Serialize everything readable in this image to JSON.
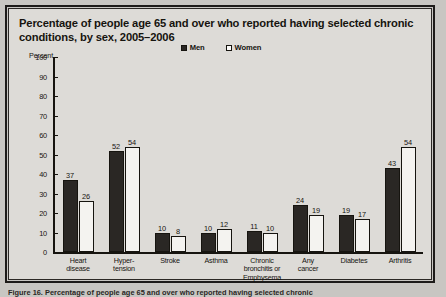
{
  "figure": {
    "title": "Percentage of people age 65 and over who reported having selected chronic conditions, by sex, 2005–2006",
    "axis_title": "Percent",
    "caption": "Figure 16. Percentage of people age 65 and over who reported having selected chronic"
  },
  "legend": {
    "items": [
      {
        "label": "Men",
        "marker": "filled-square-icon",
        "color": "#2a2724"
      },
      {
        "label": "Women",
        "marker": "open-square-icon",
        "color": "#ffffff"
      }
    ]
  },
  "chart_data": {
    "type": "bar",
    "title": "Percentage of people age 65 and over who reported having selected chronic conditions, by sex, 2005–2006",
    "xlabel": "",
    "ylabel": "Percent",
    "ylim": [
      0,
      100
    ],
    "yticks": [
      0,
      10,
      20,
      30,
      40,
      50,
      60,
      70,
      80,
      90,
      100
    ],
    "grid": false,
    "legend_position": "top-center",
    "categories": [
      "Heart disease",
      "Hyper-tension",
      "Stroke",
      "Asthma",
      "Chronic bronchitis or Emphysema",
      "Any cancer",
      "Diabetes",
      "Arthritis"
    ],
    "category_lines": [
      [
        "Heart",
        "disease"
      ],
      [
        "Hyper-",
        "tension"
      ],
      [
        "Stroke"
      ],
      [
        "Asthma"
      ],
      [
        "Chronic",
        "bronchitis or",
        "Emphysema"
      ],
      [
        "Any",
        "cancer"
      ],
      [
        "Diabetes"
      ],
      [
        "Arthritis"
      ]
    ],
    "series": [
      {
        "name": "Men",
        "values": [
          37,
          52,
          10,
          10,
          11,
          24,
          19,
          43
        ]
      },
      {
        "name": "Women",
        "values": [
          26,
          54,
          8,
          12,
          10,
          19,
          17,
          54
        ]
      }
    ]
  }
}
